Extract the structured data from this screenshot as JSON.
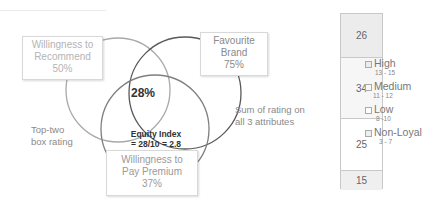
{
  "venn": {
    "recommend": {
      "line1": "Willingness to",
      "line2": "Recommend",
      "pct": "50%"
    },
    "brand": {
      "line1": "Favourite",
      "line2": "Brand",
      "pct": "75%"
    },
    "premium": {
      "line1": "Willingness to",
      "line2": "Pay Premium",
      "pct": "37%"
    },
    "intersection_pct": "28%",
    "equity_line1": "Equity Index",
    "equity_line2": "= 28/10 = 2.8",
    "colors": {
      "recommend": "#a9a9a9",
      "brand": "#595959",
      "premium": "#7f7f7f"
    }
  },
  "notes": {
    "top_two_line1": "Top-two",
    "top_two_line2": "box rating",
    "sum_line1": "Sum of rating on",
    "sum_line2": "all 3 attributes"
  },
  "bar": {
    "segments": [
      {
        "value": "26",
        "color": "#ececec"
      },
      {
        "value": "34",
        "color": "#f6f6f6"
      },
      {
        "value": "25",
        "color": "#ffffff"
      },
      {
        "value": "15",
        "color": "#efefef"
      }
    ]
  },
  "legend": [
    {
      "label": "High",
      "range": "13 - 15"
    },
    {
      "label": "Medium",
      "range": "11 - 12"
    },
    {
      "label": "Low",
      "range": "8 -10"
    },
    {
      "label": "Non-Loyal",
      "range": "3 - 7"
    }
  ]
}
